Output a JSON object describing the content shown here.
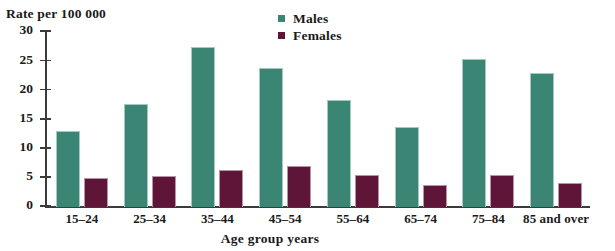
{
  "chart_data": {
    "type": "bar",
    "title": "",
    "subtitle": "",
    "xlabel": "Age group  years",
    "ylabel": "Rate per 100 000",
    "categories": [
      "15–24",
      "25–34",
      "35–44",
      "45–54",
      "55–64",
      "65–74",
      "75–84",
      "85 and over"
    ],
    "series": [
      {
        "name": "Males",
        "color": "#3a8573",
        "values": [
          13.0,
          17.7,
          27.4,
          23.8,
          18.3,
          13.8,
          25.3,
          23.0
        ]
      },
      {
        "name": "Females",
        "color": "#5e1538",
        "values": [
          5.0,
          5.4,
          6.4,
          7.1,
          5.5,
          3.8,
          5.5,
          4.2
        ]
      }
    ],
    "ylim": [
      0,
      30
    ],
    "yticks": [
      0,
      5,
      10,
      15,
      20,
      25,
      30
    ],
    "ytick_labels": [
      "0",
      "5",
      "10",
      "15",
      "20",
      "25",
      "30"
    ],
    "grid": false,
    "legend_position": "top-center"
  },
  "legend": {
    "items": [
      {
        "label": "Males",
        "swatch_name": "legend-swatch-males"
      },
      {
        "label": "Females",
        "swatch_name": "legend-swatch-females"
      }
    ]
  },
  "axis": {
    "y_title": "Rate per 100 000",
    "x_title": "Age group  years"
  }
}
